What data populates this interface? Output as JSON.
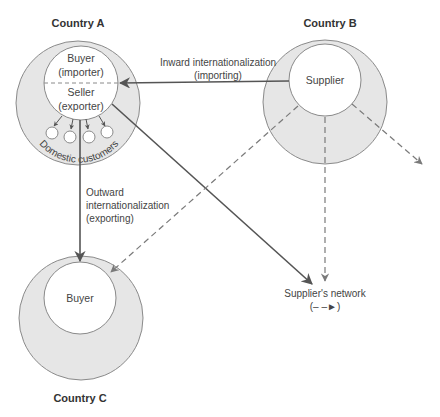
{
  "colors": {
    "outer_fill": "#e6e6e6",
    "outer_stroke": "#8a8a8a",
    "inner_fill": "#ffffff",
    "solid_arrow": "#555555",
    "dashed_arrow": "#7a7a7a",
    "text": "#444444"
  },
  "countries": {
    "a": {
      "title": "Country A",
      "buyer_line1": "Buyer",
      "buyer_line2": "(importer)",
      "seller_line1": "Seller",
      "seller_line2": "(exporter)",
      "ring_label": "Domestic customers"
    },
    "b": {
      "title": "Country B",
      "supplier_label": "Supplier"
    },
    "c": {
      "title": "Country C",
      "buyer_label": "Buyer"
    }
  },
  "flows": {
    "inward_line1": "Inward internationalization",
    "inward_line2": "(importing)",
    "outward_line1": "Outward",
    "outward_line2": "internationalization",
    "outward_line3": "(exporting)"
  },
  "network": {
    "label": "Supplier's network",
    "legend": "(– –►)"
  }
}
